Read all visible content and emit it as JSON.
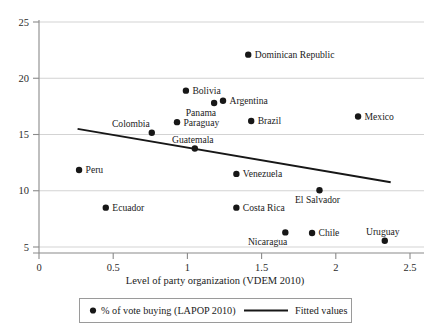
{
  "chart_data": {
    "type": "scatter",
    "title": "",
    "xlabel": "Level of party organization (VDEM 2010)",
    "ylabel": "",
    "xlim": [
      0,
      2.5
    ],
    "ylim": [
      5,
      25
    ],
    "xticks": [
      "0",
      "0.5",
      "1",
      "1.5",
      "2",
      "2.5"
    ],
    "xtick_values": [
      0,
      0.5,
      1,
      1.5,
      2,
      2.5
    ],
    "yticks": [
      "25",
      "20",
      "15",
      "10",
      "5"
    ],
    "ytick_values": [
      25,
      20,
      15,
      10,
      5
    ],
    "grid": "horizontal",
    "legend_position": "below",
    "series": [
      {
        "name": "% of vote buying (LAPOP 2010)",
        "marker": "filled-circle",
        "color": "#171717",
        "points": [
          {
            "label": "Dominican Republic",
            "x": 1.41,
            "y": 22.1,
            "label_pos": "right"
          },
          {
            "label": "Bolivia",
            "x": 0.99,
            "y": 18.9,
            "label_pos": "right"
          },
          {
            "label": "Argentina",
            "x": 1.24,
            "y": 18.0,
            "label_pos": "right"
          },
          {
            "label": "Panama",
            "x": 1.18,
            "y": 17.8,
            "label_pos": "below-left"
          },
          {
            "label": "Mexico",
            "x": 2.15,
            "y": 16.6,
            "label_pos": "right"
          },
          {
            "label": "Brazil",
            "x": 1.43,
            "y": 16.2,
            "label_pos": "right"
          },
          {
            "label": "Paraguay",
            "x": 0.93,
            "y": 16.1,
            "label_pos": "right"
          },
          {
            "label": "Colombia",
            "x": 0.76,
            "y": 15.15,
            "label_pos": "above-left"
          },
          {
            "label": "Guatemala",
            "x": 1.05,
            "y": 13.75,
            "label_pos": "above-right"
          },
          {
            "label": "Peru",
            "x": 0.27,
            "y": 11.85,
            "label_pos": "right"
          },
          {
            "label": "Venezuela",
            "x": 1.33,
            "y": 11.5,
            "label_pos": "right"
          },
          {
            "label": "El Salvador",
            "x": 1.89,
            "y": 10.05,
            "label_pos": "below-right"
          },
          {
            "label": "Ecuador",
            "x": 0.45,
            "y": 8.5,
            "label_pos": "right"
          },
          {
            "label": "Costa Rica",
            "x": 1.33,
            "y": 8.5,
            "label_pos": "right"
          },
          {
            "label": "Nicaragua",
            "x": 1.66,
            "y": 6.3,
            "label_pos": "below-left"
          },
          {
            "label": "Chile",
            "x": 1.84,
            "y": 6.25,
            "label_pos": "right"
          },
          {
            "label": "Uruguay",
            "x": 2.33,
            "y": 5.55,
            "label_pos": "above-right"
          }
        ]
      }
    ],
    "fit_line": {
      "name": "Fitted values",
      "color": "#171717",
      "x0": 0.26,
      "y0": 15.5,
      "x1": 2.37,
      "y1": 10.75
    }
  },
  "legend": {
    "scatter_label": "% of vote buying (LAPOP 2010)",
    "fit_label": "Fitted values"
  },
  "axis": {
    "x_title": "Level of party organization (VDEM 2010)"
  }
}
